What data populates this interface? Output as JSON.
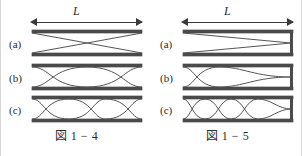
{
  "page": {
    "background": "#ffffff",
    "ink_color": "#2b2b2b",
    "wall_color": "#4a4a4a",
    "wave_color": "#555555"
  },
  "figures": [
    {
      "id": "figure-left",
      "caption": "図 1 − 4",
      "dimension_label": "L",
      "pipe_type": "open-open",
      "closed_right_end": false,
      "rows": [
        {
          "label": "(a)",
          "antinodes": 1,
          "harmonic": 1,
          "wavelengths_in_L": 0.5
        },
        {
          "label": "(b)",
          "antinodes": 2,
          "harmonic": 2,
          "wavelengths_in_L": 1.0
        },
        {
          "label": "(c)",
          "antinodes": 3,
          "harmonic": 3,
          "wavelengths_in_L": 1.5
        }
      ]
    },
    {
      "id": "figure-right",
      "caption": "図 1 − 5",
      "dimension_label": "L",
      "pipe_type": "open-closed",
      "closed_right_end": true,
      "rows": [
        {
          "label": "(a)",
          "antinodes": 1,
          "harmonic": 1,
          "wavelengths_in_L": 0.25
        },
        {
          "label": "(b)",
          "antinodes": 2,
          "harmonic": 3,
          "wavelengths_in_L": 0.75
        },
        {
          "label": "(c)",
          "antinodes": 3,
          "harmonic": 5,
          "wavelengths_in_L": 1.25
        }
      ]
    }
  ]
}
